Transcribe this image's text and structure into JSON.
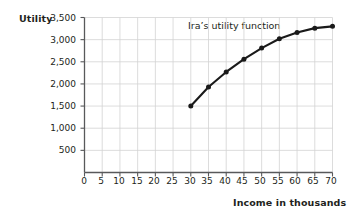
{
  "chart_data": {
    "type": "line",
    "title": "",
    "annotations": [
      {
        "text": "Ira’s utility function",
        "x": 46,
        "y": 3380
      }
    ],
    "xlabel": "Income in thousands",
    "ylabel": "Utility",
    "xlim": [
      0,
      70
    ],
    "ylim": [
      0,
      3500
    ],
    "xticks": [
      0,
      5,
      10,
      15,
      20,
      25,
      30,
      35,
      40,
      45,
      50,
      55,
      60,
      65,
      70
    ],
    "xtick_labels": [
      "0",
      "5",
      "10",
      "15",
      "20",
      "25",
      "30",
      "35",
      "40",
      "45",
      "50",
      "55",
      "60",
      "65",
      "70"
    ],
    "yticks": [
      0,
      500,
      1000,
      1500,
      2000,
      2500,
      3000,
      3500
    ],
    "ytick_labels": [
      "",
      "500",
      "1,000",
      "1,500",
      "2,000",
      "2,500",
      "3,000",
      "3,500"
    ],
    "grid": true,
    "legend": "none",
    "series": [
      {
        "name": "Ira’s utility function",
        "marker": "filled-circle",
        "color": "#1a1a1a",
        "x": [
          30,
          35,
          40,
          45,
          50,
          55,
          60,
          65,
          70
        ],
        "values": [
          1500,
          1930,
          2270,
          2560,
          2810,
          3020,
          3160,
          3260,
          3300
        ]
      }
    ]
  },
  "colors": {
    "grid": "#d3d3d3",
    "axis": "#58595b",
    "line": "#1a1a1a",
    "text": "#231f20",
    "background": "#ffffff"
  }
}
